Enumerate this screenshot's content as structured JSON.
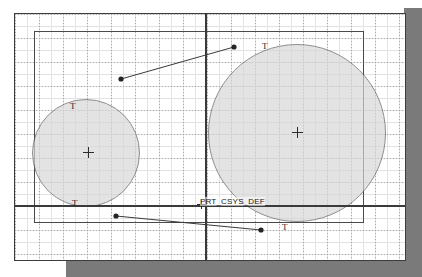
{
  "app": {
    "kind": "cad-sketch-viewport",
    "title": "Sketch graphics window"
  },
  "canvas": {
    "background_color": "#ffffff",
    "frame_color": "#3c3c3c",
    "shadow_color": "#7a7a7a",
    "grid": {
      "visible": true,
      "style": "dotted",
      "major_spacing_px": 24,
      "minor_spacing_px": 12,
      "color": "#a9a9a9"
    }
  },
  "datums": {
    "csys_label": "PRT_CSYS_DEF",
    "vertical_axis_name": "vertical-datum-axis",
    "horizontal_axis_name": "horizontal-datum-axis",
    "axis_color": "#3a3a3a"
  },
  "entities": {
    "rectangle": {
      "name": "sketch-rectangle",
      "stroke": "#4a4a4a"
    },
    "circles": [
      {
        "name": "circle-left",
        "center_marker": "+",
        "fill": "#d6d6d6",
        "stroke": "#5a5a5a"
      },
      {
        "name": "circle-right",
        "center_marker": "+",
        "fill": "#d6d6d6",
        "stroke": "#5a5a5a"
      }
    ]
  },
  "constraints": {
    "symbol": "T",
    "label": "T",
    "items": [
      {
        "name": "tangent-left-top",
        "label": "T"
      },
      {
        "name": "tangent-left-bottom",
        "label": "T"
      },
      {
        "name": "tangent-right-top",
        "label": "T"
      },
      {
        "name": "tangent-right-bottom",
        "label": "T"
      }
    ]
  },
  "leaders": [
    {
      "name": "leader-upper",
      "from": [
        120,
        78
      ],
      "to": [
        233,
        46
      ]
    },
    {
      "name": "leader-lower",
      "from": [
        115,
        215
      ],
      "to": [
        260,
        229
      ]
    }
  ]
}
